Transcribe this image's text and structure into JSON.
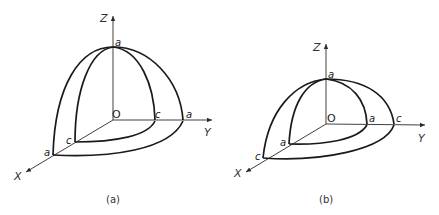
{
  "figure": {
    "panels": [
      {
        "id": "a",
        "caption": "(a)",
        "axes": {
          "x": "X",
          "y": "Y",
          "z": "Z",
          "origin": "O"
        },
        "intercepts": {
          "z_top": "a",
          "y_inner": "c",
          "y_outer": "a",
          "x_inner": "c",
          "x_outer": "a"
        }
      },
      {
        "id": "b",
        "caption": "(b)",
        "axes": {
          "x": "X",
          "y": "Y",
          "z": "Z",
          "origin": "O"
        },
        "intercepts": {
          "z_top": "a",
          "y_inner": "a",
          "y_outer": "c",
          "x_inner": "a",
          "x_outer": "c"
        }
      }
    ]
  }
}
